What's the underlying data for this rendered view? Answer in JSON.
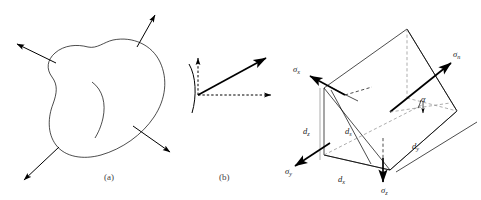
{
  "figure": {
    "background_color": "#ffffff",
    "line_color": "#000000",
    "panel_count": 3
  },
  "captions": [
    {
      "id": "caption-a",
      "text": "(a)",
      "x": 108,
      "y": 177
    },
    {
      "id": "caption-b",
      "text": "(b)",
      "x": 223,
      "y": 177
    }
  ],
  "panel_a": {
    "name": "body-with-traction-vectors",
    "description": "Irregular closed body with four traction arrows pointing outward and an interior curve",
    "arrow_count": 4,
    "interior_curve": true
  },
  "panel_b": {
    "name": "surface-element-vectors",
    "description": "Small curved surface element with a solid resultant stress vector and dashed normal and tangential component arrows",
    "solid_vector_count": 1,
    "dashed_vector_count": 2
  },
  "panel_c": {
    "name": "stress-wedge-element",
    "description": "Three dimensional wedge element showing stress components on its faces and its edge dimensions",
    "labels": [
      {
        "id": "sigma-x",
        "symbol": "σ",
        "sub": "x",
        "x": 296,
        "y": 72,
        "kind": "stress"
      },
      {
        "id": "sigma-n",
        "symbol": "σ",
        "sub": "n",
        "x": 456,
        "y": 57,
        "kind": "stress"
      },
      {
        "id": "sigma-y",
        "symbol": "σ",
        "sub": "y",
        "x": 288,
        "y": 172,
        "kind": "stress"
      },
      {
        "id": "sigma-z",
        "symbol": "σ",
        "sub": "z",
        "x": 384,
        "y": 191,
        "kind": "stress"
      },
      {
        "id": "alpha",
        "symbol": "α",
        "sub": "",
        "x": 424,
        "y": 100,
        "kind": "angle"
      },
      {
        "id": "dim-dz",
        "symbol": "d",
        "sub": "z",
        "x": 307,
        "y": 132,
        "kind": "dimension"
      },
      {
        "id": "dim-ds",
        "symbol": "d",
        "sub": "s",
        "x": 349,
        "y": 132,
        "kind": "dimension"
      },
      {
        "id": "dim-dx",
        "symbol": "d",
        "sub": "x",
        "x": 342,
        "y": 180,
        "kind": "dimension"
      },
      {
        "id": "dim-dy",
        "symbol": "d",
        "sub": "y",
        "x": 416,
        "y": 147,
        "kind": "dimension"
      }
    ]
  }
}
